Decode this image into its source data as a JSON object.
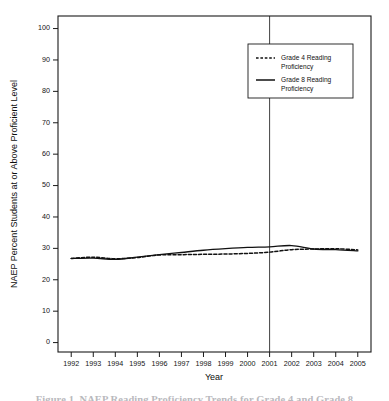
{
  "chart_data": {
    "type": "line",
    "title": "",
    "xlabel": "Year",
    "ylabel": "NAEP Percent Students at or Above Proficient Level",
    "x": [
      1992,
      1993,
      1994,
      1995,
      1996,
      1997,
      1998,
      1999,
      2000,
      2001,
      2002,
      2003,
      2004,
      2005
    ],
    "xtick_labels": [
      "1992",
      "1993",
      "1994",
      "1995",
      "1996",
      "1997",
      "1998",
      "1999",
      "2000",
      "2001",
      "2002",
      "2003",
      "2004",
      "2005"
    ],
    "ytick_labels": [
      "0",
      "10",
      "20",
      "30",
      "40",
      "50",
      "60",
      "70",
      "80",
      "90",
      "100"
    ],
    "ytick_values": [
      0,
      10,
      20,
      30,
      40,
      50,
      60,
      70,
      80,
      90,
      100
    ],
    "xlim": [
      1991.4,
      2005.6
    ],
    "ylim": [
      -3,
      104
    ],
    "grid": false,
    "legend_position": "upper-right",
    "series": [
      {
        "name": "Grade 4 Reading Proficiency",
        "style": "dashed",
        "color": "#111111",
        "values": [
          26.8,
          27.2,
          26.7,
          27.1,
          27.9,
          28.0,
          28.1,
          28.2,
          28.4,
          28.8,
          29.6,
          29.8,
          29.9,
          29.5
        ]
      },
      {
        "name": "Grade 8 Reading Proficiency",
        "style": "solid",
        "color": "#111111",
        "values": [
          26.8,
          26.9,
          26.5,
          27.2,
          28.0,
          28.7,
          29.4,
          29.9,
          30.3,
          30.5,
          30.9,
          29.8,
          29.6,
          29.2
        ]
      }
    ],
    "annotations": [
      {
        "name": "reference-line-2001",
        "type": "vertical-line",
        "x": 2001,
        "label": "2001"
      }
    ],
    "legend_entries": [
      {
        "label_line1": "Grade 4 Reading",
        "label_line2": "Proficiency",
        "style": "dashed"
      },
      {
        "label_line1": "Grade 8 Reading",
        "label_line2": "Proficiency",
        "style": "solid"
      }
    ]
  },
  "caption": {
    "text": "Figure 1. NAEP Reading Proficiency Trends for Grade 4 and Grade 8"
  }
}
